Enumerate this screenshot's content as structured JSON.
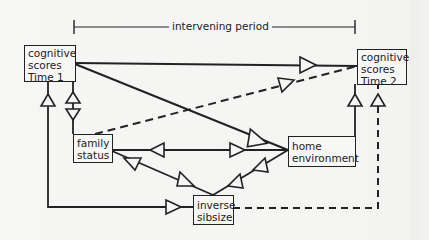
{
  "diagram": {
    "period": {
      "label": "intervening period"
    },
    "nodes": {
      "time1": {
        "lines": [
          "cognitive",
          "scores",
          "Time 1"
        ]
      },
      "time2": {
        "lines": [
          "cognitive",
          "scores",
          "Time 2"
        ]
      },
      "family": {
        "lines": [
          "family",
          "status"
        ]
      },
      "home": {
        "lines": [
          "home",
          "environment"
        ]
      },
      "sibsize": {
        "lines": [
          "inverse",
          "sibsize"
        ]
      }
    },
    "edges": [
      {
        "from": "cognitive scores Time 1",
        "to": "cognitive scores Time 2",
        "style": "solid"
      },
      {
        "from": "cognitive scores Time 1",
        "to": "home environment",
        "style": "solid"
      },
      {
        "from": "family status",
        "to": "cognitive scores Time 2",
        "style": "dashed"
      },
      {
        "from": "cognitive scores Time 1",
        "to": "family status",
        "style": "solid",
        "bidirectional": true
      },
      {
        "from": "inverse sibsize",
        "to": "cognitive scores Time 1",
        "style": "solid"
      },
      {
        "from": "family status",
        "to": "home environment",
        "style": "solid",
        "bidirectional": true
      },
      {
        "from": "inverse sibsize",
        "to": "family status",
        "style": "solid"
      },
      {
        "from": "inverse sibsize",
        "to": "home environment",
        "style": "solid"
      },
      {
        "from": "home environment",
        "to": "cognitive scores Time 2",
        "style": "solid"
      },
      {
        "from": "inverse sibsize",
        "to": "cognitive scores Time 2",
        "style": "dashed"
      }
    ],
    "colors": {
      "ink": "#222222",
      "paper": "#f6f6f5"
    }
  }
}
